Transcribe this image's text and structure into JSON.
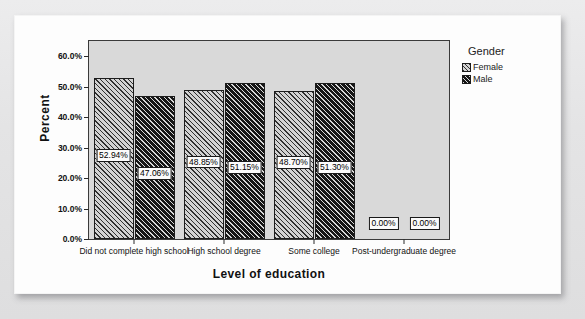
{
  "chart_data": {
    "type": "bar",
    "title": "",
    "xlabel": "Level of education",
    "ylabel": "Percent",
    "ylim": [
      0,
      65
    ],
    "grid": false,
    "legend_position": "right",
    "legend_title": "Gender",
    "categories": [
      "Did not complete high school",
      "High school degree",
      "Some college",
      "Post-undergraduate degree"
    ],
    "ytick_labels": [
      "0.0%",
      "10.0%",
      "20.0%",
      "30.0%",
      "40.0%",
      "50.0%",
      "60.0%"
    ],
    "ytick_values": [
      0,
      10,
      20,
      30,
      40,
      50,
      60
    ],
    "series": [
      {
        "name": "Female",
        "values": [
          52.94,
          48.85,
          48.7,
          0.0
        ],
        "labels": [
          "52.94%",
          "48.85%",
          "48.70%",
          "0.00%"
        ]
      },
      {
        "name": "Male",
        "values": [
          47.06,
          51.15,
          51.3,
          0.0
        ],
        "labels": [
          "47.06%",
          "51.15%",
          "51.30%",
          "0.00%"
        ]
      }
    ]
  },
  "legend": {
    "title": "Gender",
    "items": [
      {
        "label": "Female",
        "pattern": "light-hatch"
      },
      {
        "label": "Male",
        "pattern": "dark-hatch"
      }
    ]
  },
  "axes": {
    "y_title": "Percent",
    "x_title": "Level of education"
  }
}
